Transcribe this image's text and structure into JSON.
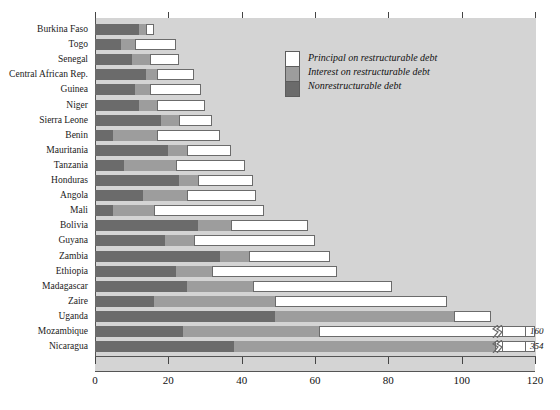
{
  "chart_data": {
    "type": "bar",
    "orientation": "horizontal",
    "stacked": true,
    "title": "",
    "xlabel": "",
    "ylabel": "",
    "xlim": [
      0,
      120
    ],
    "xticks": [
      0,
      20,
      40,
      60,
      80,
      100,
      120
    ],
    "xticklabels": [
      "0",
      "20",
      "40",
      "60",
      "80",
      "100",
      "120"
    ],
    "grid": false,
    "legend_position": "top-right-inside",
    "series": [
      {
        "name": "Principal on restructurable debt",
        "color": "#ffffff"
      },
      {
        "name": "Interest on restructurable debt",
        "color": "#9d9d9d"
      },
      {
        "name": "Nonrestructurable debt",
        "color": "#6b6b6b"
      }
    ],
    "categories": [
      "Burkina Faso",
      "Togo",
      "Senegal",
      "Central African Rep.",
      "Guinea",
      "Niger",
      "Sierra Leone",
      "Benin",
      "Mauritania",
      "Tanzania",
      "Honduras",
      "Angola",
      "Mali",
      "Bolivia",
      "Guyana",
      "Zambia",
      "Ethiopia",
      "Madagascar",
      "Zaire",
      "Uganda",
      "Mozambique",
      "Nicaragua"
    ],
    "rows": [
      {
        "category": "Burkina Faso",
        "nonrestructurable": 12,
        "interest": 2,
        "principal": 2,
        "total": 16
      },
      {
        "category": "Togo",
        "nonrestructurable": 7,
        "interest": 4,
        "principal": 11,
        "total": 22
      },
      {
        "category": "Senegal",
        "nonrestructurable": 10,
        "interest": 5,
        "principal": 8,
        "total": 23
      },
      {
        "category": "Central African Rep.",
        "nonrestructurable": 14,
        "interest": 3,
        "principal": 10,
        "total": 27
      },
      {
        "category": "Guinea",
        "nonrestructurable": 11,
        "interest": 4,
        "principal": 14,
        "total": 29
      },
      {
        "category": "Niger",
        "nonrestructurable": 12,
        "interest": 5,
        "principal": 13,
        "total": 30
      },
      {
        "category": "Sierra Leone",
        "nonrestructurable": 18,
        "interest": 5,
        "principal": 9,
        "total": 32
      },
      {
        "category": "Benin",
        "nonrestructurable": 5,
        "interest": 12,
        "principal": 17,
        "total": 34
      },
      {
        "category": "Mauritania",
        "nonrestructurable": 20,
        "interest": 5,
        "principal": 12,
        "total": 37
      },
      {
        "category": "Tanzania",
        "nonrestructurable": 8,
        "interest": 14,
        "principal": 19,
        "total": 41
      },
      {
        "category": "Honduras",
        "nonrestructurable": 23,
        "interest": 5,
        "principal": 15,
        "total": 43
      },
      {
        "category": "Angola",
        "nonrestructurable": 13,
        "interest": 12,
        "principal": 19,
        "total": 44
      },
      {
        "category": "Mali",
        "nonrestructurable": 5,
        "interest": 11,
        "principal": 30,
        "total": 46
      },
      {
        "category": "Bolivia",
        "nonrestructurable": 28,
        "interest": 9,
        "principal": 21,
        "total": 58
      },
      {
        "category": "Guyana",
        "nonrestructurable": 19,
        "interest": 8,
        "principal": 33,
        "total": 60
      },
      {
        "category": "Zambia",
        "nonrestructurable": 34,
        "interest": 8,
        "principal": 22,
        "total": 64
      },
      {
        "category": "Ethiopia",
        "nonrestructurable": 22,
        "interest": 10,
        "principal": 34,
        "total": 66
      },
      {
        "category": "Madagascar",
        "nonrestructurable": 25,
        "interest": 18,
        "principal": 38,
        "total": 81
      },
      {
        "category": "Zaire",
        "nonrestructurable": 16,
        "interest": 33,
        "principal": 47,
        "total": 96
      },
      {
        "category": "Uganda",
        "nonrestructurable": 49,
        "interest": 49,
        "principal": 10,
        "total": 108
      },
      {
        "category": "Mozambique",
        "nonrestructurable": 24,
        "interest": 37,
        "principal": 99,
        "total": 160,
        "broken_axis": true,
        "break_label": "160"
      },
      {
        "category": "Nicaragua",
        "nonrestructurable": 38,
        "interest": 71,
        "principal": 245,
        "total": 354,
        "broken_axis": true,
        "break_label": "354"
      }
    ],
    "annotations": [
      {
        "text": "160",
        "for": "Mozambique",
        "note": "value beyond broken axis"
      },
      {
        "text": "354",
        "for": "Nicaragua",
        "note": "value beyond broken axis"
      }
    ]
  },
  "legend": {
    "items": [
      {
        "label": "Principal on restructurable debt"
      },
      {
        "label": "Interest on restructurable debt"
      },
      {
        "label": "Nonrestructurable debt"
      }
    ]
  }
}
